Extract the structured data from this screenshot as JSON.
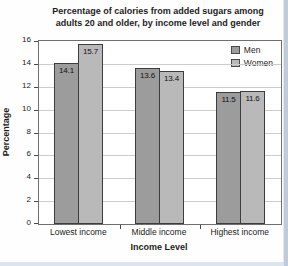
{
  "page": {
    "edge_right_color": "#c0cbda",
    "edge_bottom_color": "#dde4ee"
  },
  "chart_data": {
    "type": "bar",
    "title_lines": [
      "Percentage of calories from added sugars among",
      "adults 20 and older, by income level and gender"
    ],
    "title": "Percentage of calories from added sugars among adults 20 and older, by income level and gender",
    "categories": [
      "Lowest income",
      "Middle income",
      "Highest income"
    ],
    "series": [
      {
        "name": "Men",
        "values": [
          14.1,
          13.6,
          11.5
        ],
        "color": "#9c9c9c"
      },
      {
        "name": "Women",
        "values": [
          15.7,
          13.4,
          11.6
        ],
        "color": "#b9b9b9"
      }
    ],
    "value_labels": [
      "14.1",
      "15.7",
      "13.6",
      "13.4",
      "11.5",
      "11.6"
    ],
    "xlabel": "Income Level",
    "ylabel": "Percentage",
    "ylim": [
      0,
      16
    ],
    "ytick_step": 2,
    "yticks": [
      0,
      2,
      4,
      6,
      8,
      10,
      12,
      14,
      16
    ],
    "grid": true,
    "legend_position": "top-right",
    "bar_border_color": "#3d3d3d",
    "grid_color": "#cccccc",
    "frame_color": "#6f6f6f"
  }
}
